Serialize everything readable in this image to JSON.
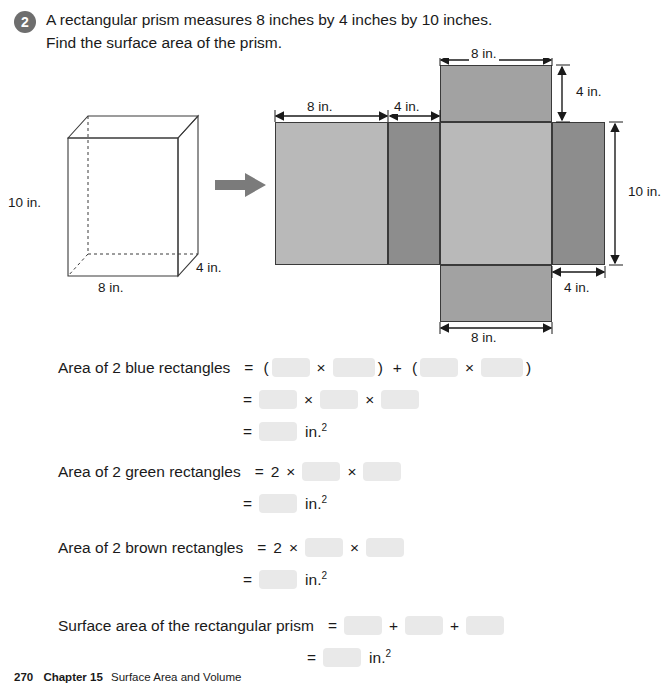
{
  "question": {
    "number": "2",
    "line1": "A rectangular prism measures 8 inches by 4 inches by 10 inches.",
    "line2": "Find the surface area of the prism."
  },
  "prism": {
    "label_height": "10 in.",
    "label_width": "8 in.",
    "label_depth": "4 in."
  },
  "net": {
    "dim_top": "8 in.",
    "dim_left_width": "8 in.",
    "dim_mid_width": "4 in.",
    "dim_top_height": "4 in.",
    "dim_right_height": "10 in.",
    "dim_right_width": "4 in.",
    "dim_bottom": "8 in.",
    "color_blue_face": "#b9b9b9",
    "color_green_face": "#8d8d8d",
    "color_brown_face": "#a2a2a2",
    "stroke": "#3a3a3a"
  },
  "solution": {
    "blue": {
      "label": "Area of 2 blue rectangles",
      "eq1": {
        "eq": "=",
        "open1": "(",
        "times1": "×",
        "close1": ")",
        "plus": "+",
        "open2": "(",
        "times2": "×",
        "close2": ")"
      },
      "eq2": {
        "eq": "=",
        "times1": "×",
        "times2": "×"
      },
      "eq3": {
        "eq": "=",
        "unit": "in.",
        "exp": "2"
      }
    },
    "green": {
      "label": "Area of 2 green rectangles",
      "eq1": {
        "eq": "=",
        "coef": "2",
        "times1": "×",
        "times2": "×"
      },
      "eq2": {
        "eq": "=",
        "unit": "in.",
        "exp": "2"
      }
    },
    "brown": {
      "label": "Area of 2 brown rectangles",
      "eq1": {
        "eq": "=",
        "coef": "2",
        "times1": "×",
        "times2": "×"
      },
      "eq2": {
        "eq": "=",
        "unit": "in.",
        "exp": "2"
      }
    },
    "total": {
      "label": "Surface area of the rectangular prism",
      "eq1": {
        "eq": "=",
        "plus1": "+",
        "plus2": "+"
      },
      "eq2": {
        "eq": "=",
        "unit": "in.",
        "exp": "2"
      }
    }
  },
  "footer": {
    "page": "270",
    "chapter": "Chapter 15",
    "title": "Surface Area and Volume"
  }
}
